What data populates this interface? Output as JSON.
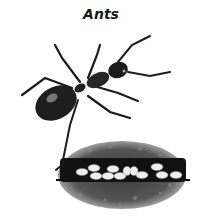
{
  "title": "Ants",
  "illustration": {
    "subject": "ant-icon",
    "secondary": "ant-nest-with-eggs",
    "colors": {
      "ink": "#1b1b1b",
      "soil_dark": "#2a2a2a",
      "soil_mid": "#5a5a5a",
      "egg": "#ececec",
      "background": "#ffffff"
    }
  }
}
